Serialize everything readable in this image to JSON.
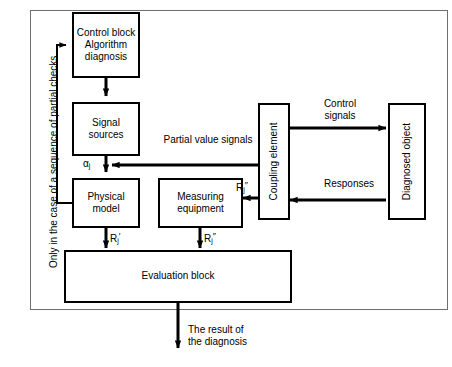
{
  "diagram": {
    "line_color": "#000000",
    "frame_color": "#6f6f6f",
    "background": "#ffffff",
    "side_note": "Only in the case of a sequence of partial checks",
    "boxes": [
      {
        "id": "control-block",
        "label": "Control block\nAlgorithm\ndiagnosis",
        "orientation": "horizontal"
      },
      {
        "id": "signal-sources",
        "label": "Signal\nsources",
        "orientation": "horizontal"
      },
      {
        "id": "physical-model",
        "label": "Physical\nmodel",
        "orientation": "horizontal"
      },
      {
        "id": "measuring-equipment",
        "label": "Measuring\nequipment",
        "orientation": "horizontal"
      },
      {
        "id": "evaluation-block",
        "label": "Evaluation block",
        "orientation": "horizontal"
      },
      {
        "id": "coupling-element",
        "label": "Coupling element",
        "orientation": "vertical"
      },
      {
        "id": "diagnosed-object",
        "label": "Diagnosed object",
        "orientation": "vertical"
      }
    ],
    "edge_labels": [
      {
        "id": "partial-value-signals",
        "text": "Partial value signals"
      },
      {
        "id": "control-signals",
        "text": "Control\nsignals"
      },
      {
        "id": "responses",
        "text": "Responses"
      },
      {
        "id": "result-of-diagnosis",
        "text": "The result of\nthe diagnosis"
      }
    ],
    "symbols": [
      {
        "id": "alpha-j",
        "base": "α",
        "sub": "j",
        "sup": ""
      },
      {
        "id": "rj-prime-model",
        "base": "R",
        "sub": "j",
        "sup": "′"
      },
      {
        "id": "rj-star-measuring-out",
        "base": "R",
        "sub": "j",
        "sup": "″"
      },
      {
        "id": "rj-star-coupling",
        "base": "R",
        "sub": "j",
        "sup": "″"
      }
    ]
  }
}
